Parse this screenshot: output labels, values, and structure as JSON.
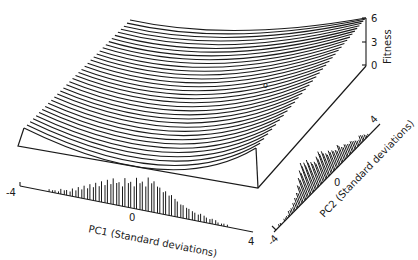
{
  "chart_data": {
    "type": "surface3d",
    "title": "",
    "axes": {
      "x": {
        "label": "PC1 (Standard deviations)",
        "ticks": [
          "-4",
          "0",
          "4"
        ],
        "range": [
          -4,
          4
        ]
      },
      "y": {
        "label": "PC2 (Standard deviations)",
        "ticks": [
          "-4",
          "0",
          "4"
        ],
        "range": [
          -4,
          4
        ]
      },
      "z": {
        "label": "Fitness",
        "ticks": [
          "0",
          "3",
          "6"
        ],
        "range": [
          0,
          6
        ]
      }
    },
    "surface": {
      "n_profile_lines": 36,
      "shape": "saddle-like bowl rising toward high PC2 corner, peak fitness ~6 at PC1=4, PC2=4",
      "marker": {
        "symbol": "o",
        "approx_position": "near PC1≈2, PC2≈2 on surface"
      }
    },
    "histograms": {
      "pc1": {
        "x": [
          -3.0,
          -2.8,
          -2.6,
          -2.4,
          -2.2,
          -2.0,
          -1.8,
          -1.6,
          -1.4,
          -1.2,
          -1.0,
          -0.8,
          -0.6,
          -0.4,
          -0.2,
          0.0,
          0.2,
          0.4,
          0.6,
          0.8,
          1.0,
          1.2,
          1.4,
          1.6,
          1.8,
          2.0,
          2.2,
          2.4,
          2.6,
          2.8,
          3.0
        ],
        "heights": [
          1,
          1,
          2,
          2,
          3,
          4,
          5,
          6,
          7,
          8,
          9,
          10,
          9,
          11,
          10,
          12,
          11,
          13,
          12,
          10,
          9,
          8,
          6,
          5,
          4,
          3,
          3,
          2,
          2,
          1,
          1
        ]
      },
      "pc2": {
        "x": [
          -3.6,
          -3.2,
          -3.0,
          -2.8,
          -2.6,
          -2.4,
          -2.2,
          -2.0,
          -1.8,
          -1.6,
          -1.4,
          -1.2,
          -1.0,
          -0.8,
          -0.6,
          -0.4,
          -0.2,
          0.0,
          0.2,
          0.4,
          0.6,
          0.8,
          1.0,
          1.2,
          1.4,
          1.6,
          1.8,
          2.0,
          2.2,
          2.4,
          2.6,
          2.8,
          3.0
        ],
        "heights": [
          1,
          1,
          1,
          2,
          2,
          3,
          4,
          5,
          7,
          9,
          11,
          13,
          12,
          12,
          10,
          9,
          10,
          11,
          10,
          8,
          8,
          7,
          6,
          7,
          5,
          5,
          4,
          4,
          3,
          2,
          3,
          2,
          1
        ]
      }
    },
    "legend": null,
    "grid": false
  },
  "labels": {
    "pc1_axis": "PC1 (Standard deviations)",
    "pc2_axis": "PC2 (Standard deviations)",
    "fitness_axis": "Fitness",
    "pc1_min": "-4",
    "pc1_mid": "0",
    "pc1_max": "4",
    "pc2_min": "-4",
    "pc2_mid": "0",
    "pc2_max": "4",
    "fit_0": "0",
    "fit_3": "3",
    "fit_6": "6",
    "marker": "o"
  },
  "colors": {
    "ink": "#1a1a1a",
    "background": "#ffffff"
  }
}
